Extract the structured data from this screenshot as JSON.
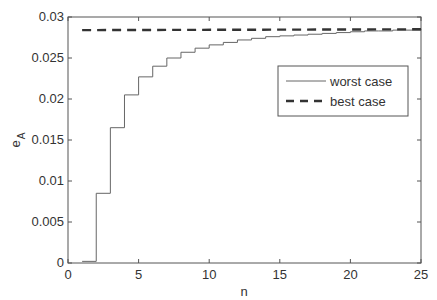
{
  "chart_data": {
    "type": "line",
    "title": "",
    "xlabel": "n",
    "ylabel": "e_A",
    "xlim": [
      0,
      25
    ],
    "ylim": [
      0,
      0.03
    ],
    "xticks": [
      0,
      5,
      10,
      15,
      20,
      25
    ],
    "xtick_labels": [
      "0",
      "5",
      "10",
      "15",
      "20",
      "25"
    ],
    "yticks": [
      0,
      0.005,
      0.01,
      0.015,
      0.02,
      0.025,
      0.03
    ],
    "ytick_labels": [
      "0",
      "0.005",
      "0.01",
      "0.015",
      "0.02",
      "0.025",
      "0.03"
    ],
    "grid": false,
    "legend_position": "upper right (inside, below top)",
    "series": [
      {
        "name": "worst case",
        "style": "solid thin step",
        "x": [
          1,
          2,
          3,
          4,
          5,
          6,
          7,
          8,
          9,
          10,
          11,
          12,
          13,
          14,
          15,
          16,
          17,
          18,
          19,
          20,
          21,
          22,
          23,
          24,
          25
        ],
        "values": [
          0.0002,
          0.0085,
          0.0165,
          0.0205,
          0.0227,
          0.024,
          0.025,
          0.0257,
          0.0262,
          0.0266,
          0.0269,
          0.0272,
          0.0274,
          0.0276,
          0.0277,
          0.0278,
          0.0279,
          0.028,
          0.0281,
          0.0282,
          0.0283,
          0.0283,
          0.0284,
          0.0284,
          0.0285
        ]
      },
      {
        "name": "best case",
        "style": "dashed thick",
        "x": [
          1,
          25
        ],
        "values": [
          0.0284,
          0.0285
        ]
      }
    ]
  },
  "legend": {
    "items": [
      {
        "label": "worst case"
      },
      {
        "label": "best case"
      }
    ]
  },
  "axes": {
    "xlabel": "n",
    "ylabel_main": "e",
    "ylabel_sub": "A"
  }
}
